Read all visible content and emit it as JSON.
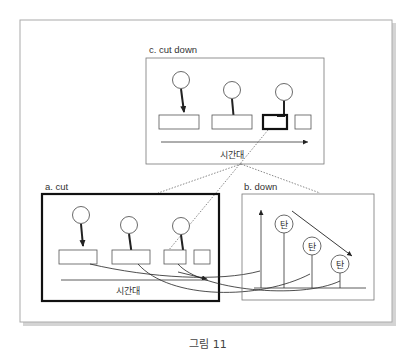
{
  "figure": {
    "caption": "그림 11",
    "panels": {
      "c": {
        "label": "c. cut down",
        "axis_label": "시간대"
      },
      "a": {
        "label": "a. cut",
        "axis_label": "시간대"
      },
      "b": {
        "label": "b. down",
        "node_label": "탄",
        "nodes": [
          "탄",
          "탄",
          "탄"
        ]
      }
    },
    "colors": {
      "line": "#222222",
      "frame": "#999999",
      "shadow": "#c8c8c8",
      "box": "#555555"
    }
  }
}
